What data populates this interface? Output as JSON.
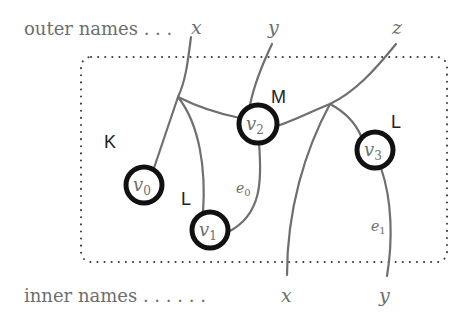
{
  "diagram": {
    "type": "bigraph",
    "outer_names_label": "outer names . . .",
    "inner_names_label": "inner names . . . . . .",
    "outer_names": [
      {
        "id": "outer-x",
        "label": "x"
      },
      {
        "id": "outer-y",
        "label": "y"
      },
      {
        "id": "outer-z",
        "label": "z"
      }
    ],
    "inner_names": [
      {
        "id": "inner-x",
        "label": "x"
      },
      {
        "id": "inner-y",
        "label": "y"
      }
    ],
    "nodes": [
      {
        "id": "v0",
        "label": "v",
        "sub": "0",
        "control": "K"
      },
      {
        "id": "v1",
        "label": "v",
        "sub": "1",
        "control": "L"
      },
      {
        "id": "v2",
        "label": "v",
        "sub": "2",
        "control": "M"
      },
      {
        "id": "v3",
        "label": "v",
        "sub": "3",
        "control": "L"
      }
    ],
    "edges": [
      {
        "id": "e0",
        "label": "e",
        "sub": "0"
      },
      {
        "id": "e1",
        "label": "e",
        "sub": "1"
      }
    ],
    "colors": {
      "link": "#6f6f6f",
      "node_outline": "#111111",
      "region_border": "#3a3a3a",
      "text": "#6e6e6e"
    }
  }
}
